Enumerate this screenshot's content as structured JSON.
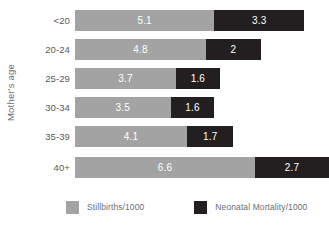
{
  "chart_data": {
    "type": "bar",
    "orientation": "horizontal",
    "stacked": true,
    "title": "",
    "xlabel": "",
    "ylabel": "Mother's age",
    "grid": false,
    "legend_position": "bottom",
    "xlim": [
      0,
      9.3
    ],
    "categories": [
      "<20",
      "20-24",
      "25-29",
      "30-34",
      "35-39",
      "40+"
    ],
    "series": [
      {
        "name": "Stillbirths/1000",
        "color": "#a3a3a3",
        "values": [
          5.1,
          4.8,
          3.7,
          3.5,
          4.1,
          6.6
        ],
        "labels": [
          "5.1",
          "4.8",
          "3.7",
          "3.5",
          "4.1",
          "6.6"
        ]
      },
      {
        "name": "Neonatal Mortality/1000",
        "color": "#231f20",
        "values": [
          3.3,
          2,
          1.6,
          1.6,
          1.7,
          2.7
        ],
        "labels": [
          "3.3",
          "2",
          "1.6",
          "1.6",
          "1.7",
          "2.7"
        ]
      }
    ],
    "totals": [
      8.4,
      6.8,
      5.3,
      5.1,
      5.8,
      9.3
    ]
  },
  "axis": {
    "y_title": "Mother's age"
  },
  "rows": [
    {
      "category": "<20",
      "a_label": "5.1",
      "a_value": 5.1,
      "b_label": "3.3",
      "b_value": 3.3
    },
    {
      "category": "20-24",
      "a_label": "4.8",
      "a_value": 4.8,
      "b_label": "2",
      "b_value": 2
    },
    {
      "category": "25-29",
      "a_label": "3.7",
      "a_value": 3.7,
      "b_label": "1.6",
      "b_value": 1.6
    },
    {
      "category": "30-34",
      "a_label": "3.5",
      "a_value": 3.5,
      "b_label": "1.6",
      "b_value": 1.6
    },
    {
      "category": "35-39",
      "a_label": "4.1",
      "a_value": 4.1,
      "b_label": "1.7",
      "b_value": 1.7
    },
    {
      "category": "40+",
      "a_label": "6.6",
      "a_value": 6.6,
      "b_label": "2.7",
      "b_value": 2.7
    }
  ],
  "legend": {
    "items": [
      {
        "label": "Stillbirths/1000",
        "color": "#a3a3a3"
      },
      {
        "label": "Neonatal Mortality/1000",
        "color": "#231f20"
      }
    ]
  },
  "colors": {
    "series_a": "#a3a3a3",
    "series_b": "#231f20",
    "text": "#6d6e71",
    "category_text": "#58595b",
    "value_text": "#ffffff",
    "background": "#ffffff"
  }
}
